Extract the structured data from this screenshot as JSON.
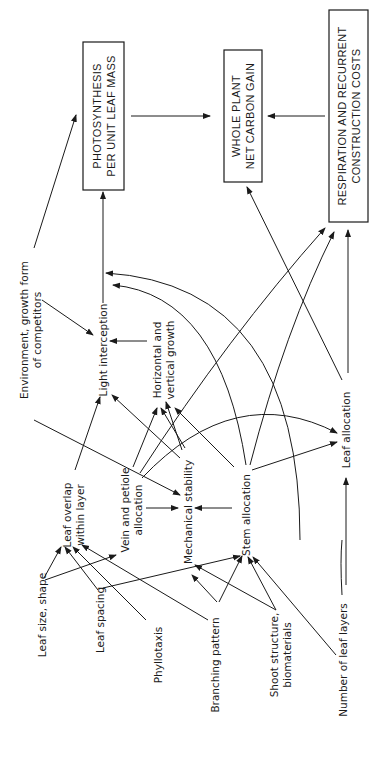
{
  "figure": {
    "orientation": "rotated-90-ccw",
    "boxes": [
      {
        "id": "photosynthesis",
        "lines": [
          "PHOTOSYNTHESIS",
          "PER UNIT LEAF MASS"
        ],
        "x": 83,
        "y": 42,
        "w": 41,
        "h": 148
      },
      {
        "id": "whole_plant",
        "lines": [
          "WHOLE PLANT",
          "NET CARBON GAIN"
        ],
        "x": 224,
        "y": 50,
        "w": 38,
        "h": 132
      },
      {
        "id": "respiration",
        "lines": [
          "RESPIRATION AND RECURRENT",
          "CONSTRUCTION COSTS"
        ],
        "x": 329,
        "y": 10,
        "w": 39,
        "h": 212
      }
    ],
    "nodes": [
      {
        "id": "environment",
        "lines": [
          "Environment, growth form",
          "of competitors"
        ],
        "cx": 30,
        "cy": 330
      },
      {
        "id": "light_interception",
        "lines": [
          "Light interception"
        ],
        "cx": 103,
        "cy": 350
      },
      {
        "id": "horizontal_vertical",
        "lines": [
          "Horizontal and",
          "vertical growth"
        ],
        "cx": 163,
        "cy": 360
      },
      {
        "id": "leaf_overlap",
        "lines": [
          "Leaf overlap",
          "within layer"
        ],
        "cx": 73,
        "cy": 515
      },
      {
        "id": "vein_petiole",
        "lines": [
          "Vein and petiole",
          "allocation"
        ],
        "cx": 131,
        "cy": 510
      },
      {
        "id": "mechanical_stability",
        "lines": [
          "Mechanical stability"
        ],
        "cx": 188,
        "cy": 512
      },
      {
        "id": "stem_allocation",
        "lines": [
          "Stem allocation"
        ],
        "cx": 246,
        "cy": 515
      },
      {
        "id": "leaf_allocation",
        "lines": [
          "Leaf allocation"
        ],
        "cx": 346,
        "cy": 430
      },
      {
        "id": "leaf_size",
        "lines": [
          "Leaf size, shape"
        ],
        "cx": 42,
        "cy": 615
      },
      {
        "id": "leaf_spacing",
        "lines": [
          "Leaf spacing"
        ],
        "cx": 100,
        "cy": 620
      },
      {
        "id": "phyllotaxis",
        "lines": [
          "Phyllotaxis"
        ],
        "cx": 158,
        "cy": 655
      },
      {
        "id": "branching_pattern",
        "lines": [
          "Branching pattern"
        ],
        "cx": 215,
        "cy": 665
      },
      {
        "id": "shoot_structure",
        "lines": [
          "Shoot structure,",
          "biomaterials"
        ],
        "cx": 280,
        "cy": 655
      },
      {
        "id": "number_leaf_layers",
        "lines": [
          "Number of leaf layers"
        ],
        "cx": 343,
        "cy": 660
      }
    ],
    "edges": [
      {
        "d": "M131,116 L210,116",
        "arrow": true
      },
      {
        "d": "M325,116 L268,116",
        "arrow": true
      },
      {
        "d": "M103,303 L103,192",
        "arrow": true
      },
      {
        "d": "M34,248 L76,115",
        "arrow": true
      },
      {
        "d": "M42,300 L93,335",
        "arrow": true
      },
      {
        "d": "M147,341 L110,341",
        "arrow": true
      },
      {
        "d": "M34,420 L180,495",
        "arrow": true
      },
      {
        "d": "M75,470 L100,397",
        "arrow": true
      },
      {
        "d": "M133,467 L157,408",
        "arrow": true
      },
      {
        "d": "M185,448 L161,408",
        "arrow": true
      },
      {
        "d": "M182,450 L166,402",
        "arrow": true
      },
      {
        "d": "M234,467 L175,408",
        "arrow": true
      },
      {
        "d": "M180,458 L112,395",
        "arrow": true
      },
      {
        "d": "M146,508 L178,508",
        "arrow": true
      },
      {
        "d": "M232,508 L195,508",
        "arrow": true
      },
      {
        "d": "M140,473 Q228,337 325,228",
        "arrow": true
      },
      {
        "d": "M142,478 Q235,380 337,433",
        "arrow": true
      },
      {
        "d": "M250,465 Q285,330 334,232",
        "arrow": true
      },
      {
        "d": "M252,470 L337,442",
        "arrow": true
      },
      {
        "d": "M246,465 Q220,295 113,285",
        "arrow": true
      },
      {
        "d": "M300,540 Q300,285 106,273",
        "arrow": true
      },
      {
        "d": "M342,380 L247,187",
        "arrow": true
      },
      {
        "d": "M348,373 L348,230",
        "arrow": true
      },
      {
        "d": "M346,585 L346,478",
        "arrow": true
      },
      {
        "d": "M342,595 Q340,560 342,540",
        "arrow": false
      },
      {
        "d": "M44,578 L61,547",
        "arrow": true
      },
      {
        "d": "M45,580 L116,555",
        "arrow": true
      },
      {
        "d": "M98,590 L65,547",
        "arrow": true
      },
      {
        "d": "M103,588 L240,556",
        "arrow": true
      },
      {
        "d": "M146,620 L73,547",
        "arrow": true
      },
      {
        "d": "M208,620 L82,545",
        "arrow": true
      },
      {
        "d": "M217,602 L192,575",
        "arrow": true
      },
      {
        "d": "M219,602 L242,556",
        "arrow": true
      },
      {
        "d": "M276,610 L195,565",
        "arrow": true
      },
      {
        "d": "M276,610 L248,557",
        "arrow": true
      },
      {
        "d": "M336,655 L253,557",
        "arrow": true
      }
    ]
  }
}
